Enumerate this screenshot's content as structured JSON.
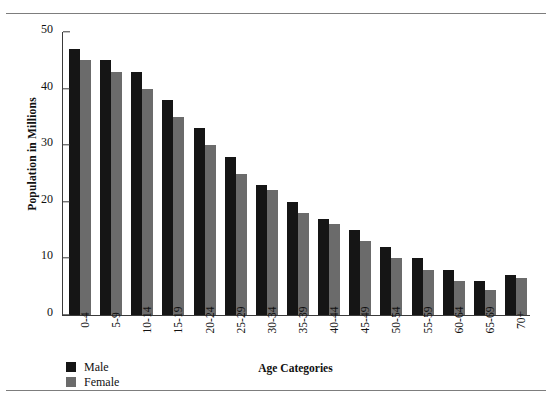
{
  "figure": {
    "y_axis_title": "Population in Millions",
    "x_axis_title": "Age Categories"
  },
  "legend": {
    "items": [
      {
        "label": "Male",
        "color": "#151515"
      },
      {
        "label": "Female",
        "color": "#6b6b6b"
      }
    ]
  },
  "axis": {
    "yticks": [
      "0",
      "10",
      "20",
      "30",
      "40",
      "50"
    ]
  },
  "chart_data": {
    "type": "bar",
    "title": "",
    "xlabel": "Age Categories",
    "ylabel": "Population in Millions",
    "ylim": [
      0,
      50
    ],
    "ytick_step": 10,
    "grid": false,
    "legend_position": "bottom-left",
    "orientation": "vertical",
    "grouping": "clustered",
    "categories": [
      "0-4",
      "5-9",
      "10-14",
      "15-19",
      "20-24",
      "25-29",
      "30-34",
      "35-39",
      "40-44",
      "45-49",
      "50-54",
      "55-59",
      "60-64",
      "65-69",
      "70+"
    ],
    "series": [
      {
        "name": "Male",
        "color": "#151515",
        "values": [
          47,
          45,
          43,
          38,
          33,
          28,
          23,
          20,
          17,
          15,
          12,
          10,
          8,
          6,
          7
        ]
      },
      {
        "name": "Female",
        "color": "#6b6b6b",
        "values": [
          45,
          43,
          40,
          35,
          30,
          25,
          22,
          18,
          16,
          13,
          10,
          8,
          6,
          4.5,
          6.5
        ]
      }
    ]
  }
}
